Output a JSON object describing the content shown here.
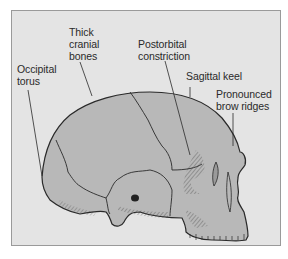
{
  "figure": {
    "background_color": "#e4e4e4",
    "bone_color": "#b8b8b8",
    "line_color": "#2a2a2a",
    "labels": [
      {
        "id": "thick-cranial-bones",
        "text": "Thick\ncranial\nbones"
      },
      {
        "id": "occipital-torus",
        "text": "Occipital\ntorus"
      },
      {
        "id": "postorbital-constriction",
        "text": "Postorbital\nconstriction"
      },
      {
        "id": "sagittal-keel",
        "text": "Sagittal keel"
      },
      {
        "id": "pronounced-brow-ridges",
        "text": "Pronounced\nbrow ridges"
      }
    ]
  }
}
